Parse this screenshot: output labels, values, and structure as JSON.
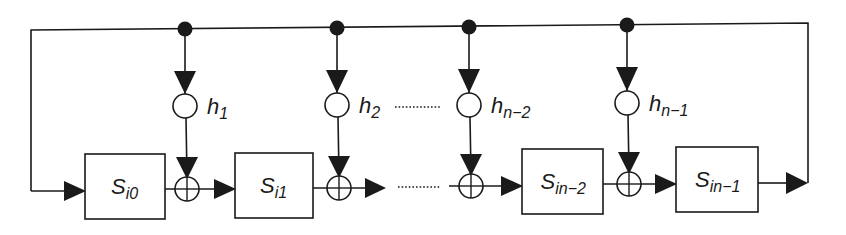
{
  "diagram": {
    "type": "feedback shift register",
    "colors": {
      "line": "#1a1a1a",
      "background": "#ffffff"
    },
    "blocks": [
      {
        "id": "s0",
        "base": "S",
        "sub": "i0",
        "x": 85,
        "y": 154,
        "w": 80,
        "h": 65
      },
      {
        "id": "s1",
        "base": "S",
        "sub": "i1",
        "x": 235,
        "y": 153,
        "w": 78,
        "h": 65
      },
      {
        "id": "sn2",
        "base": "S",
        "sub": "in−2",
        "x": 522,
        "y": 149,
        "w": 81,
        "h": 65
      },
      {
        "id": "sn1",
        "base": "S",
        "sub": "in−1",
        "x": 676,
        "y": 147,
        "w": 82,
        "h": 65
      }
    ],
    "taps": [
      {
        "id": "h1",
        "base": "h",
        "sub": "1",
        "x": 185,
        "tapY": 29,
        "multY": 106,
        "addY": 189
      },
      {
        "id": "h2",
        "base": "h",
        "sub": "2",
        "x": 337,
        "tapY": 28,
        "multY": 105,
        "addY": 188
      },
      {
        "id": "hn2",
        "base": "h",
        "sub": "n−2",
        "x": 469,
        "tapY": 27,
        "multY": 105,
        "addY": 186
      },
      {
        "id": "hn1",
        "base": "h",
        "sub": "n−1",
        "x": 627,
        "tapY": 25,
        "multY": 103,
        "addY": 184
      }
    ],
    "ellipsis": "………"
  }
}
